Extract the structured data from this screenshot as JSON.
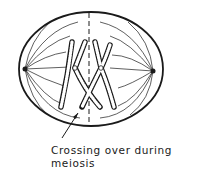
{
  "diagram": {
    "elements": [
      "cell-membrane",
      "spindle-fibers",
      "centrosome-left",
      "centrosome-right",
      "equatorial-plate",
      "chromosome-pair"
    ],
    "caption_line1": "Crossing over during",
    "caption_line2": "meiosis",
    "colors": {
      "stroke": "#1a1a1a",
      "background": "#ffffff"
    }
  }
}
